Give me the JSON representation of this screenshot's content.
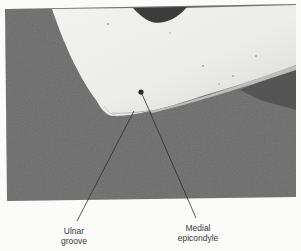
{
  "figure": {
    "colors": {
      "background": "#fbfbfa",
      "photo_backdrop": "#6b6b6b",
      "skin": "#e6e6e4",
      "marker_dot": "#2a2a2a",
      "leader_line": "#2e2e2e",
      "label_text": "#3a3a3a"
    },
    "labels": [
      {
        "id": "ulnar-groove",
        "line1": "Ulnar",
        "line2": "groove"
      },
      {
        "id": "medial-epicondyle",
        "line1": "Medial",
        "line2": "epicondyle"
      }
    ]
  }
}
